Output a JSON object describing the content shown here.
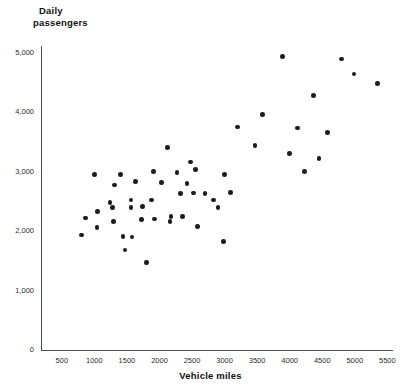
{
  "chart_data": {
    "type": "scatter",
    "title": "",
    "ylabel": "Daily passengers",
    "xlabel": "Vehicle miles",
    "xlim": [
      0,
      5800
    ],
    "ylim": [
      0,
      5300
    ],
    "xticks": [
      500,
      1000,
      1500,
      2000,
      2500,
      3000,
      3500,
      4000,
      4500,
      5000,
      5500
    ],
    "xtick_labels": [
      "500",
      "1000",
      "1500",
      "2000",
      "2500",
      "3000",
      "3500",
      "4000",
      "4500",
      "5000",
      "5500"
    ],
    "yticks": [
      0,
      1000,
      2000,
      3000,
      4000,
      5000
    ],
    "ytick_labels": [
      "0",
      "1,000",
      "2,000",
      "3,000",
      "4,000",
      "5,000"
    ],
    "grid": false,
    "legend": false,
    "marker_color": "#1c1c1c",
    "axis_color": "#4d4d4d",
    "points": [
      {
        "x": 800,
        "y": 1930
      },
      {
        "x": 860,
        "y": 2220
      },
      {
        "x": 1000,
        "y": 2950
      },
      {
        "x": 1040,
        "y": 2060
      },
      {
        "x": 1050,
        "y": 2330
      },
      {
        "x": 1240,
        "y": 2480
      },
      {
        "x": 1280,
        "y": 2390
      },
      {
        "x": 1290,
        "y": 2160
      },
      {
        "x": 1310,
        "y": 2770
      },
      {
        "x": 1400,
        "y": 2950
      },
      {
        "x": 1440,
        "y": 1910
      },
      {
        "x": 1470,
        "y": 1680
      },
      {
        "x": 1560,
        "y": 2520
      },
      {
        "x": 1560,
        "y": 2390
      },
      {
        "x": 1580,
        "y": 1900
      },
      {
        "x": 1630,
        "y": 2830
      },
      {
        "x": 1720,
        "y": 2190
      },
      {
        "x": 1740,
        "y": 2410
      },
      {
        "x": 1800,
        "y": 1470
      },
      {
        "x": 1880,
        "y": 2520
      },
      {
        "x": 1910,
        "y": 3000
      },
      {
        "x": 1920,
        "y": 2200
      },
      {
        "x": 2030,
        "y": 2820
      },
      {
        "x": 2120,
        "y": 3400
      },
      {
        "x": 2160,
        "y": 2160
      },
      {
        "x": 2180,
        "y": 2240
      },
      {
        "x": 2270,
        "y": 2980
      },
      {
        "x": 2320,
        "y": 2630
      },
      {
        "x": 2350,
        "y": 2240
      },
      {
        "x": 2420,
        "y": 2800
      },
      {
        "x": 2480,
        "y": 3160
      },
      {
        "x": 2520,
        "y": 2640
      },
      {
        "x": 2550,
        "y": 3030
      },
      {
        "x": 2580,
        "y": 2080
      },
      {
        "x": 2700,
        "y": 2630
      },
      {
        "x": 2830,
        "y": 2520
      },
      {
        "x": 2900,
        "y": 2390
      },
      {
        "x": 2980,
        "y": 1820
      },
      {
        "x": 3000,
        "y": 2950
      },
      {
        "x": 3090,
        "y": 2650
      },
      {
        "x": 3200,
        "y": 3750
      },
      {
        "x": 3470,
        "y": 3440
      },
      {
        "x": 3580,
        "y": 3960
      },
      {
        "x": 3890,
        "y": 4930
      },
      {
        "x": 4000,
        "y": 3300
      },
      {
        "x": 4120,
        "y": 3730
      },
      {
        "x": 4230,
        "y": 3000
      },
      {
        "x": 4370,
        "y": 4280
      },
      {
        "x": 4450,
        "y": 3220
      },
      {
        "x": 4580,
        "y": 3660
      },
      {
        "x": 4800,
        "y": 4890
      },
      {
        "x": 4990,
        "y": 4640
      },
      {
        "x": 5350,
        "y": 4480
      }
    ]
  }
}
